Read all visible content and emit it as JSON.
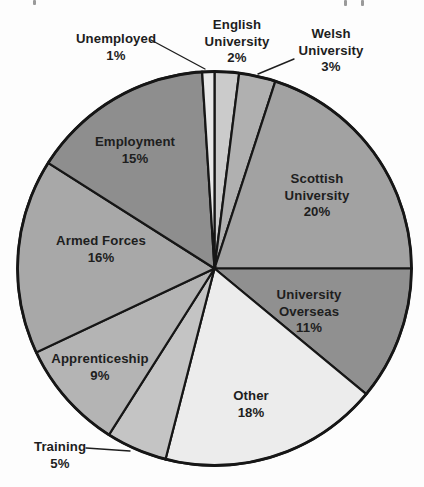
{
  "chart_data": {
    "type": "pie",
    "direction": "clockwise",
    "start_reference": "12-oclock",
    "start_angle_deg": 0,
    "unit": "%",
    "total": 100,
    "outline_color": "#161616",
    "label_color": "#1e1e1e",
    "segments": [
      {
        "id": "english-university",
        "label": "English University",
        "value": 2,
        "color": "#cbcbcb",
        "label_placement": "outside",
        "label_text": "English\nUniversity\n2%",
        "label_x": 237,
        "label_y": 42
      },
      {
        "id": "welsh-university",
        "label": "Welsh University",
        "value": 3,
        "color": "#b0b0b0",
        "label_placement": "outside",
        "label_text": "Welsh\nUniversity\n3%",
        "label_x": 331,
        "label_y": 51
      },
      {
        "id": "scottish-university",
        "label": "Scottish University",
        "value": 20,
        "color": "#a2a2a2",
        "label_placement": "inside",
        "label_text": "Scottish\nUniversity\n20%",
        "label_x": 317,
        "label_y": 196
      },
      {
        "id": "university-overseas",
        "label": "University Overseas",
        "value": 11,
        "color": "#909090",
        "label_placement": "inside",
        "label_text": "University\nOverseas\n11%",
        "label_x": 309,
        "label_y": 312
      },
      {
        "id": "other",
        "label": "Other",
        "value": 18,
        "color": "#ececec",
        "label_placement": "inside",
        "label_text": "Other\n18%",
        "label_x": 251,
        "label_y": 404
      },
      {
        "id": "training",
        "label": "Training",
        "value": 5,
        "color": "#c4c4c4",
        "label_placement": "outside",
        "label_text": "Training\n5%",
        "label_x": 60,
        "label_y": 455
      },
      {
        "id": "apprenticeship",
        "label": "Apprenticeship",
        "value": 9,
        "color": "#b4b4b4",
        "label_placement": "inside",
        "label_text": "Apprenticeship\n9%",
        "label_x": 100,
        "label_y": 367
      },
      {
        "id": "armed-forces",
        "label": "Armed Forces",
        "value": 16,
        "color": "#a8a8a8",
        "label_placement": "inside",
        "label_text": "Armed Forces\n16%",
        "label_x": 101,
        "label_y": 249
      },
      {
        "id": "employment",
        "label": "Employment",
        "value": 15,
        "color": "#8e8e8e",
        "label_placement": "inside",
        "label_text": "Employment\n15%",
        "label_x": 135,
        "label_y": 150
      },
      {
        "id": "unemployed",
        "label": "Unemployed",
        "value": 1,
        "color": "#e8e8e8",
        "label_placement": "outside",
        "label_text": "Unemployed\n1%",
        "label_x": 116,
        "label_y": 47
      }
    ],
    "leader_lines": [
      {
        "for": "unemployed",
        "x1": 151,
        "y1": 40,
        "x2": 205,
        "y2": 69
      },
      {
        "for": "welsh-university",
        "x1": 294,
        "y1": 59,
        "x2": 258,
        "y2": 74
      },
      {
        "for": "training",
        "x1": 86,
        "y1": 448,
        "x2": 130,
        "y2": 451
      }
    ],
    "geometry": {
      "cx": 214.5,
      "cy": 268.5,
      "radius": 197,
      "canvas_width": 424,
      "canvas_height": 487
    }
  }
}
